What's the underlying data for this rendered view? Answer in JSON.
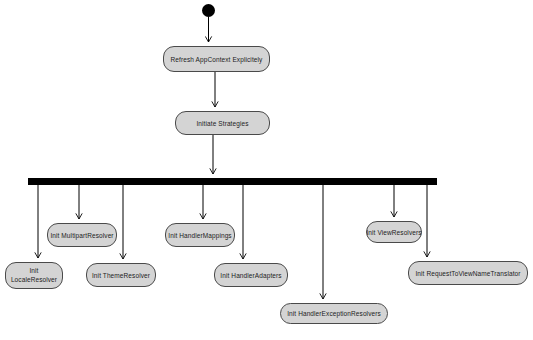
{
  "diagram": {
    "type": "uml-activity-diagram",
    "colors": {
      "background": "#ffffff",
      "node_fill": "#d4d4d4",
      "node_border": "#4a4a4a",
      "edge": "#000000",
      "fork_bar": "#000000",
      "initial_node": "#000000"
    },
    "nodes": {
      "start": {
        "kind": "initial-node"
      },
      "fork": {
        "kind": "fork-bar"
      },
      "refresh_app_context": {
        "label": "Refresh AppContext Explicitely"
      },
      "initiate_strategies": {
        "label": "Initiate Strategies"
      },
      "init_multipart_resolver": {
        "label": "Init MultipartResolver"
      },
      "init_locale_resolver": {
        "label": "Init LocaleResolver"
      },
      "init_theme_resolver": {
        "label": "Init ThemeResolver"
      },
      "init_handler_mappings": {
        "label": "Init HandlerMappings"
      },
      "init_handler_adapters": {
        "label": "Init HandlerAdapters"
      },
      "init_handler_exception_resolvers": {
        "label": "Init HandlerExceptionResolvers"
      },
      "init_view_resolvers": {
        "label": "Init ViewResolvers"
      },
      "init_request_to_view_name_translator": {
        "label": "Init RequestToViewNameTranslator"
      }
    },
    "edges": [
      {
        "from": "start",
        "to": "refresh_app_context"
      },
      {
        "from": "refresh_app_context",
        "to": "initiate_strategies"
      },
      {
        "from": "initiate_strategies",
        "to": "fork"
      },
      {
        "from": "fork",
        "to": "init_locale_resolver"
      },
      {
        "from": "fork",
        "to": "init_multipart_resolver"
      },
      {
        "from": "fork",
        "to": "init_theme_resolver"
      },
      {
        "from": "fork",
        "to": "init_handler_mappings"
      },
      {
        "from": "fork",
        "to": "init_handler_adapters"
      },
      {
        "from": "fork",
        "to": "init_handler_exception_resolvers"
      },
      {
        "from": "fork",
        "to": "init_view_resolvers"
      },
      {
        "from": "fork",
        "to": "init_request_to_view_name_translator"
      }
    ]
  }
}
